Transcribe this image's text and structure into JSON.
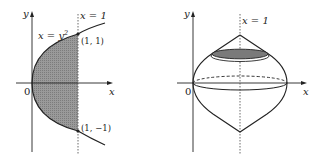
{
  "left_figure": {
    "axis_x_label": "x",
    "axis_y_label": "y",
    "origin_label": "0",
    "line_label": "x = 1",
    "curve_label_base": "x = y",
    "curve_label_exp": "2",
    "point_top_label": "(1, 1)",
    "point_bottom_label": "(1, −1)",
    "region_fill": "#8a8a8a"
  },
  "right_figure": {
    "axis_x_label": "x",
    "axis_y_label": "y",
    "origin_label": "0",
    "line_label": "x = 1",
    "cross_section_fill": "#7a7a7a"
  }
}
